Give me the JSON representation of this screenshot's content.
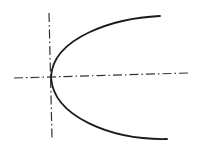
{
  "diagram": {
    "type": "parabola-sketch",
    "colors": {
      "background": "#ffffff",
      "stroke": "#1a1a1a",
      "axis": "#333333"
    },
    "horizontal_axis": {
      "x1": 14,
      "y1": 78,
      "x2": 188,
      "y2": 73,
      "style": "dash-dot"
    },
    "vertical_axis": {
      "x1": 49,
      "y1": 13,
      "x2": 52,
      "y2": 138,
      "style": "dash-dot"
    },
    "parabola": {
      "vertex": [
        51,
        77
      ],
      "upper_end": [
        160,
        16
      ],
      "lower_end": [
        167,
        139
      ]
    }
  }
}
